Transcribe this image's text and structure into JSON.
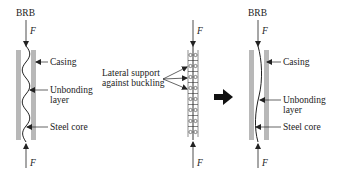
{
  "diagram": {
    "left": {
      "title": "BRB",
      "force_top": "F",
      "force_bottom": "F",
      "labels": {
        "casing": "Casing",
        "unbonding_1": "Unbonding",
        "unbonding_2": "layer",
        "steel_core": "Steel core"
      }
    },
    "middle": {
      "force_top": "F",
      "force_bottom": "F",
      "label_1": "Lateral support",
      "label_2": "against buckling"
    },
    "right": {
      "title": "BRB",
      "force_top": "F",
      "force_bottom": "F",
      "labels": {
        "casing": "Casing",
        "unbonding_1": "Unbonding",
        "unbonding_2": "layer",
        "steel_core": "Steel core"
      }
    },
    "colors": {
      "casing": "#b8b8b8",
      "line": "#222222",
      "arrow": "#111111"
    }
  }
}
